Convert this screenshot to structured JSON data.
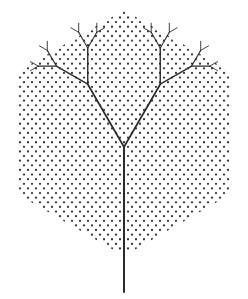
{
  "figure": {
    "caption": "",
    "width": 248,
    "height": 299,
    "background_color": "#ffffff"
  },
  "chart_data": {
    "type": "diagram",
    "xlabel": "",
    "ylabel": "",
    "grid": true,
    "legend": false,
    "xlim": [
      0,
      248
    ],
    "ylim": [
      0,
      299
    ],
    "lattice": {
      "name": "triangular-dot-lattice",
      "dot_color": "#3a3a3a",
      "dot_radius": 1.15,
      "column_spacing": 8.0,
      "row_spacing": 4.62,
      "row_offset": 4.0,
      "clip_shape": "hexagon"
    },
    "hexagon": {
      "name": "clip-hexagon",
      "center_x": 124,
      "center_y": 133,
      "circumradius": 123,
      "orientation": "pointy-top",
      "vertices": [
        [
          124,
          10
        ],
        [
          230,
          71.5
        ],
        [
          230,
          194.5
        ],
        [
          124,
          256
        ],
        [
          18,
          194.5
        ],
        [
          18,
          71.5
        ]
      ],
      "stroke": "none",
      "fill": "none"
    },
    "tree": {
      "name": "fractal-y-tree",
      "root_x": 124,
      "root_y": 292,
      "trunk_angle_deg": 90,
      "trunk_length": 145,
      "branch_angle_deg": 60,
      "length_ratio": 0.5,
      "depth": 4,
      "stroke_color": "#2b2b2b",
      "stroke_widths": [
        2.0,
        1.7,
        1.4,
        1.1,
        0.9
      ],
      "node_count": 31,
      "description": "Binary Y-tree: trunk rises from below the hexagon, splits at 60 degrees each generation, each child half the parent length"
    },
    "values": [
      145,
      72.5,
      36.25,
      18.125,
      9.06
    ],
    "categories": [
      "trunk",
      "gen-1",
      "gen-2",
      "gen-3",
      "gen-4"
    ],
    "series": [
      {
        "name": "branch_length_px",
        "values": [
          145,
          72.5,
          36.25,
          18.125,
          9.06
        ]
      },
      {
        "name": "branches_per_generation",
        "values": [
          1,
          2,
          4,
          8,
          16
        ]
      },
      {
        "name": "stroke_width_px",
        "values": [
          2.0,
          1.7,
          1.4,
          1.1,
          0.9
        ]
      }
    ]
  }
}
